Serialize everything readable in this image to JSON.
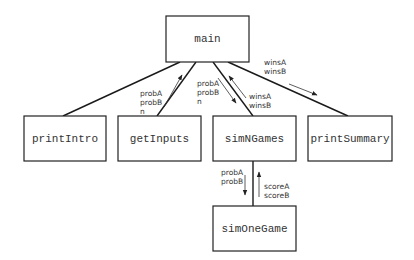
{
  "diagram": {
    "type": "structure-chart",
    "nodes": {
      "main": "main",
      "printIntro": "printIntro",
      "getInputs": "getInputs",
      "simNGames": "simNGames",
      "printSummary": "printSummary",
      "simOneGame": "simOneGame"
    },
    "flows": {
      "getInputs_to_main": [
        "probA",
        "probB",
        "n"
      ],
      "main_to_simNGames": [
        "probA",
        "probB",
        "n"
      ],
      "simNGames_to_main": [
        "winsA",
        "winsB"
      ],
      "main_to_printSummary": [
        "winsA",
        "winsB"
      ],
      "simNGames_to_simOneGame": [
        "probA",
        "probB"
      ],
      "simOneGame_to_simNGames": [
        "scoreA",
        "scoreB"
      ]
    }
  }
}
